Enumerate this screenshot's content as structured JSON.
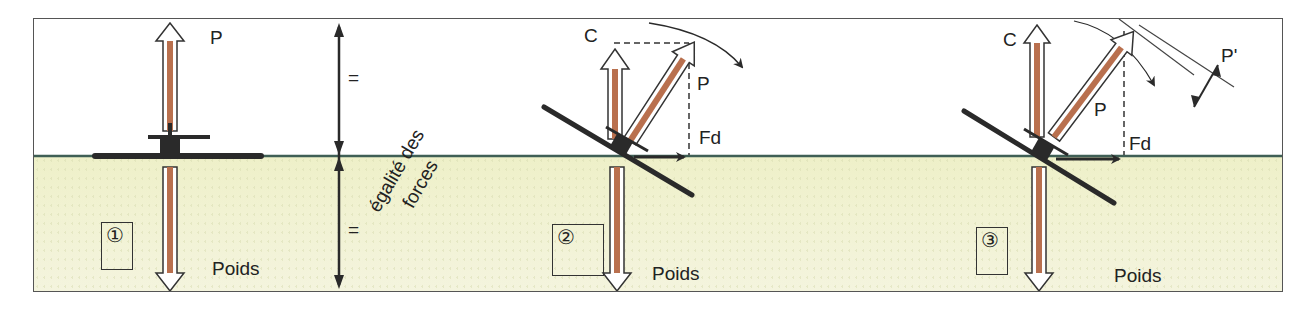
{
  "figure": {
    "colors": {
      "frame": "#555555",
      "ground": "#eef0c8",
      "horizon": "#3f5f55",
      "force_arrow_fill": "#b9704e",
      "force_arrow_outline": "#333333",
      "dark_stroke": "#2a2a2a"
    },
    "panels": [
      {
        "number": "①",
        "labels": {
          "lift": "P",
          "weight": "Poids"
        },
        "equality": {
          "upper": "=",
          "lower": "=",
          "caption_line1": "égalité des",
          "caption_line2": "forces"
        }
      },
      {
        "number": "②",
        "labels": {
          "component": "C",
          "lift": "P",
          "drag": "Fd",
          "weight": "Poids"
        }
      },
      {
        "number": "③",
        "labels": {
          "component": "C",
          "lift": "P",
          "drag": "Fd",
          "weight": "Poids",
          "reduced_lift": "P'"
        }
      }
    ]
  }
}
